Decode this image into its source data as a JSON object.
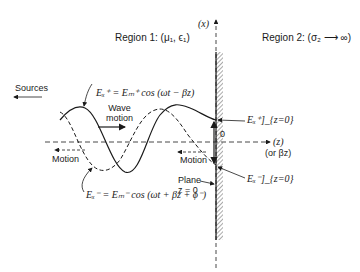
{
  "diagram": {
    "region1_label": "Region 1: (μ₁, ϵ₁)",
    "region2_label": "Region 2: (σ₂ ⟶ ∞)",
    "x_axis_label": "(x)",
    "z_axis_label": "(z)",
    "z_axis_alt_label": "(or βz)",
    "origin_label": "0",
    "sources_label": "Sources",
    "wave_motion_label_line1": "Wave",
    "wave_motion_label_line2": "motion",
    "motion_label_left": "Motion",
    "motion_label_right": "Motion",
    "plane_label_line1": "Plane",
    "plane_label_line2": "z = 0",
    "incident_wave": {
      "lhs": "Eₓ⁺",
      "eq": "= Eₘ⁺ cos (ωt − βz)"
    },
    "reflected_wave": {
      "lhs": "Eₓ⁻",
      "eq": "= Eₘ⁻ cos (ωt + βz + ϕ⁻)"
    },
    "incident_at_boundary": "Eₓ⁺]_{z=0}",
    "reflected_at_boundary": "Eₓ⁻]_{z=0}",
    "colors": {
      "line": "#1a1a1a",
      "hatch": "#555555",
      "background": "#ffffff"
    }
  }
}
